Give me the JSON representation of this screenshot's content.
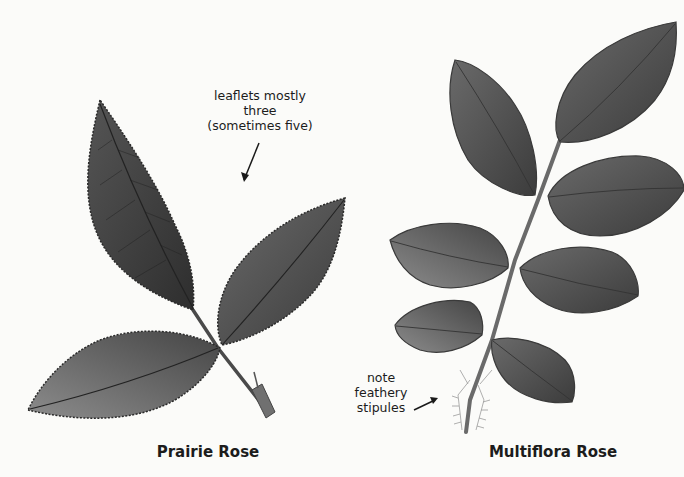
{
  "plate": {
    "background_color": "#fbfbf9",
    "leaf_color_dark": "#3a3a3a",
    "leaf_color_mid": "#5e5e5e",
    "leaf_color_light": "#8a8a8a"
  },
  "specimens": [
    {
      "name": "Prairie Rose",
      "annotation": {
        "line1": "leaflets mostly three",
        "line2": "(sometimes five)",
        "pointer": "arrow-down-left"
      },
      "leaflet_count_shown": 3
    },
    {
      "name": "Multiflora Rose",
      "annotation": {
        "line1": "note",
        "line2": "feathery",
        "line3": "stipules",
        "pointer": "arrow-up-right"
      },
      "leaflet_count_shown": 7
    }
  ]
}
